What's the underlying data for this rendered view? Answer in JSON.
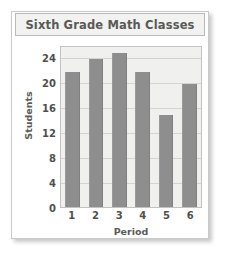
{
  "chart_data": {
    "type": "bar",
    "title": "Sixth Grade Math Classes",
    "xlabel": "Period",
    "ylabel": "Students",
    "categories": [
      "1",
      "2",
      "3",
      "4",
      "5",
      "6"
    ],
    "values": [
      22,
      24,
      25,
      22,
      15,
      20
    ],
    "yticks": [
      0,
      4,
      8,
      12,
      16,
      20,
      24
    ],
    "ylim": [
      0,
      26
    ],
    "grid": true,
    "legend": false,
    "bar_color": "#8e8e8e",
    "plot_background": "#f0f0ee",
    "gridline_color": "#d3d3d3",
    "text_color": "#4f4f4f",
    "title_color": "#595959"
  }
}
